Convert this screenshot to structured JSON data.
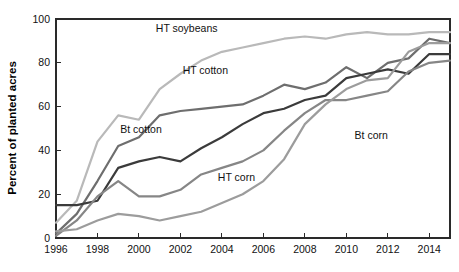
{
  "chart_data": {
    "type": "line",
    "title": "",
    "subtitle": "",
    "xlabel": "",
    "ylabel": "Percent of planted acres",
    "xlim": [
      1996,
      2015
    ],
    "ylim": [
      0,
      100
    ],
    "grid": false,
    "legend_position": "inline-annotations",
    "x": [
      1996,
      1997,
      1998,
      1999,
      2000,
      2001,
      2002,
      2003,
      2004,
      2005,
      2006,
      2007,
      2008,
      2009,
      2010,
      2011,
      2012,
      2013,
      2014,
      2015
    ],
    "x_tick_labels": [
      "1996",
      "1998",
      "2000",
      "2002",
      "2004",
      "2006",
      "2008",
      "2010",
      "2012",
      "2014"
    ],
    "x_ticks": [
      1996,
      1998,
      2000,
      2002,
      2004,
      2006,
      2008,
      2010,
      2012,
      2014
    ],
    "y_ticks": [
      0,
      20,
      40,
      60,
      80,
      100
    ],
    "y_tick_labels": [
      "0",
      "20",
      "40",
      "60",
      "80",
      "100"
    ],
    "series": [
      {
        "name": "HT soybeans",
        "color": "#b9b9b9",
        "label_x": 2002.3,
        "label_y": 94,
        "values": [
          7,
          17,
          44,
          56,
          54,
          68,
          75,
          81,
          85,
          87,
          89,
          91,
          92,
          91,
          93,
          94,
          93,
          93,
          94,
          94
        ]
      },
      {
        "name": "HT cotton",
        "color": "#6e6e6e",
        "label_x": 2003.2,
        "label_y": 75,
        "values": [
          2,
          11,
          26,
          42,
          46,
          56,
          58,
          59,
          60,
          61,
          65,
          70,
          68,
          71,
          78,
          73,
          80,
          82,
          91,
          89
        ]
      },
      {
        "name": "Bt cotton",
        "color": "#3b3b3b",
        "label_x": 2000.1,
        "label_y": 48,
        "values": [
          15,
          15,
          17,
          32,
          35,
          37,
          35,
          41,
          46,
          52,
          57,
          59,
          63,
          65,
          73,
          75,
          77,
          75,
          84,
          84
        ]
      },
      {
        "name": "Bt corn",
        "color": "#868686",
        "label_x": 2011.2,
        "label_y": 45,
        "values": [
          1,
          8,
          19,
          26,
          19,
          19,
          22,
          29,
          32,
          35,
          40,
          49,
          57,
          63,
          63,
          65,
          67,
          76,
          80,
          81
        ]
      },
      {
        "name": "HT corn",
        "color": "#9c9c9c",
        "label_x": 2004.7,
        "label_y": 26,
        "values": [
          3,
          4,
          8,
          11,
          10,
          8,
          10,
          12,
          16,
          20,
          26,
          36,
          52,
          61,
          68,
          72,
          73,
          85,
          89,
          89
        ]
      }
    ]
  },
  "plot": {
    "left": 56,
    "right": 450,
    "top": 19,
    "bottom": 238
  }
}
